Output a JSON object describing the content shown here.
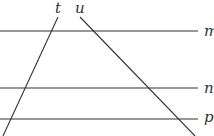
{
  "diagram": {
    "type": "parallel-lines-with-transversals",
    "line_color": "#333333",
    "background": "#ffffff",
    "horizontal_lines": [
      {
        "label": "m",
        "y": 31,
        "x1": 0,
        "x2": 198
      },
      {
        "label": "n",
        "y": 88,
        "x1": 0,
        "x2": 198
      },
      {
        "label": "p",
        "y": 119,
        "x1": 0,
        "x2": 198
      }
    ],
    "transversals": [
      {
        "label": "t",
        "x1": 58,
        "y1": 17,
        "x2": 3,
        "y2": 136
      },
      {
        "label": "u",
        "x1": 80,
        "y1": 17,
        "x2": 195,
        "y2": 136
      }
    ],
    "labels": {
      "t": "t",
      "u": "u",
      "m": "m",
      "n": "n",
      "p": "p"
    }
  }
}
